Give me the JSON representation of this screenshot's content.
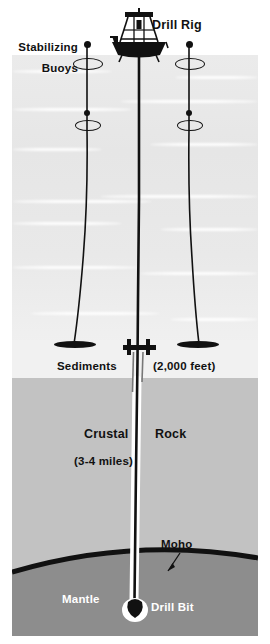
{
  "diagram": {
    "labels": {
      "drill_rig": "Drill Rig",
      "stabilizing_line1": "Stabilizing",
      "stabilizing_line2": "Buoys",
      "sediments": "Sediments",
      "sediments_depth": "(2,000 feet)",
      "crustal": "Crustal",
      "rock": "Rock",
      "crustal_depth": "(3-4 miles)",
      "moho": "Moho",
      "mantle": "Mantle",
      "drill_bit": "Drill Bit"
    },
    "layers": [
      {
        "name": "ocean",
        "label": "",
        "color": "#e8e8e8"
      },
      {
        "name": "sediments",
        "label": "Sediments",
        "thickness": "(2,000 feet)",
        "color": "#f1f1f1"
      },
      {
        "name": "crustal-rock",
        "label": "Crustal Rock",
        "thickness": "(3-4 miles)",
        "color": "#c2c2c2"
      },
      {
        "name": "mantle",
        "label": "Mantle",
        "color": "#8d8d8d"
      }
    ],
    "colors": {
      "ink": "#111111",
      "ocean": "#e8e8e8",
      "sediments": "#f1f1f1",
      "crust": "#c2c2c2",
      "mantle": "#8d8d8d",
      "moho": "#111111"
    },
    "icons": {
      "buoy": "buoy-icon",
      "anchor": "anchor-icon",
      "ship": "drill-ship-icon",
      "bit": "drill-bit-icon"
    }
  }
}
